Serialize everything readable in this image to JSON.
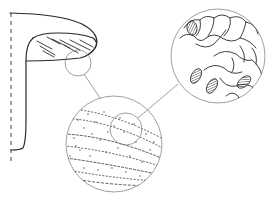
{
  "figure": {
    "description": "Line drawing: sectioned structure with two magnified circular insets",
    "colors": {
      "ink": "#2a2a2a",
      "leader": "#777777",
      "background": "#ffffff"
    },
    "elements": {
      "axis_line": "dashed vertical line",
      "main_body": "L-shaped structure with hatched upper lobe",
      "inset_1": "circular magnification showing dotted banded texture",
      "inset_2": "circular magnification showing cellular tissue with hatched ovoid bodies"
    }
  }
}
